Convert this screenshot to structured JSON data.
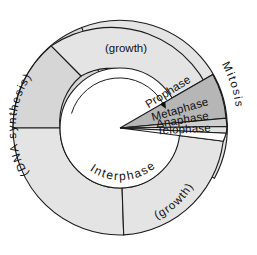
{
  "diagram": {
    "type": "annulus-pie",
    "center": {
      "x": 120,
      "y": 128
    },
    "outer_radius": 107,
    "inner_radius": 60,
    "arrow_radius": 50,
    "colors": {
      "background": "#ffffff",
      "outline": "#1a1a1a",
      "dna_synthesis_fill": "#d6d6d6",
      "growth_top_fill": "#e4e4e4",
      "growth_bottom_fill": "#e4e4e4",
      "prophase_fill": "#b6b6b6",
      "metaphase_fill": "#cfcfcf",
      "anaphase_fill": "#e2e2e2",
      "telophase_fill": "#ffffff",
      "interphase_fill": "#ffffff",
      "text": "#111111"
    },
    "interphase_label": "Interphase",
    "mitosis_label": "Mitosis",
    "sectors": [
      {
        "name": "dna-synthesis",
        "label": "(DNA synthesis)",
        "fill": "#d6d6d6",
        "start_angle": 180,
        "end_angle": 310,
        "label_placement": "curved-outer-left"
      },
      {
        "name": "growth-top",
        "label": "(growth)",
        "fill": "#e4e4e4",
        "start_angle": 310,
        "end_angle": 28,
        "label_placement": "horizontal-top"
      },
      {
        "name": "prophase",
        "label": "Prophase",
        "fill": "#b6b6b6",
        "start_angle": 28,
        "end_angle": 55,
        "label_placement": "radial-wedge"
      },
      {
        "name": "metaphase",
        "label": "Metaphase",
        "fill": "#cfcfcf",
        "start_angle": 55,
        "end_angle": 66,
        "label_placement": "radial-wedge"
      },
      {
        "name": "anaphase",
        "label": "Anaphase",
        "fill": "#e2e2e2",
        "start_angle": 66,
        "end_angle": 76,
        "label_placement": "radial-wedge"
      },
      {
        "name": "telophase",
        "label": "Telophase",
        "fill": "#ffffff",
        "start_angle": 76,
        "end_angle": 88,
        "label_placement": "radial-wedge"
      },
      {
        "name": "growth-bottom",
        "label": "(growth)",
        "fill": "#e4e4e4",
        "start_angle": 88,
        "end_angle": 180,
        "label_placement": "curved-lower-right"
      }
    ],
    "arrow": {
      "name": "cycle-direction-arrow",
      "direction": "clockwise",
      "description": "arrow on inner circle pointing clockwise toward mitosis"
    }
  }
}
